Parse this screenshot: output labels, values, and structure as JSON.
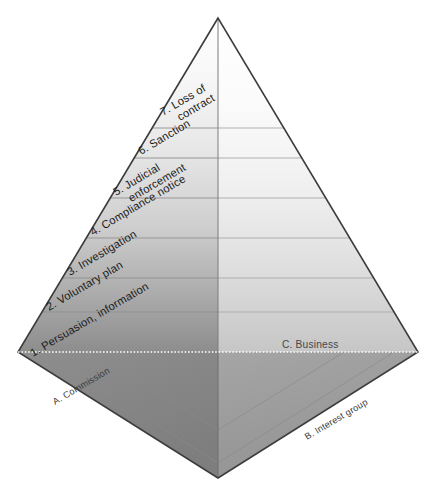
{
  "diagram": {
    "type": "3d-pyramid",
    "levels": [
      {
        "id": 7,
        "label": "7. Loss of",
        "label_line2": "contract",
        "full_label": "7. Loss of contract"
      },
      {
        "id": 6,
        "label": "6. Sanction",
        "label_line2": "",
        "full_label": "6. Sanction"
      },
      {
        "id": 5,
        "label": "5. Judicial",
        "label_line2": "enforcement",
        "full_label": "5. Judicial enforcement"
      },
      {
        "id": 4,
        "label": "4. Compliance notice",
        "label_line2": "",
        "full_label": "4. Compliance notice"
      },
      {
        "id": 3,
        "label": "3. Investigation",
        "label_line2": "",
        "full_label": "3. Investigation"
      },
      {
        "id": 2,
        "label": "2. Voluntary plan",
        "label_line2": "",
        "full_label": "2. Voluntary plan"
      },
      {
        "id": 1,
        "label": "1. Persuasion, information",
        "label_line2": "",
        "full_label": "1. Persuasion, information"
      }
    ],
    "corners": {
      "left": "A. Commission",
      "right": "B. Interest group",
      "face_right": "C. Business"
    },
    "colors": {
      "outline": "#3c3c3c",
      "divider": "#8c8c8c",
      "left_face_top": "#fbfbfb",
      "left_face_bottom": "#8f8f8f",
      "right_face_top": "#ffffff",
      "right_face_bottom": "#c9c9c9",
      "base_left": "#8a8a8a",
      "base_right": "#9d9d9d",
      "dotted_line": "#ffffff",
      "text": "#1b1b1b",
      "corner_text": "#3a3a3a",
      "background": "#ffffff"
    }
  }
}
